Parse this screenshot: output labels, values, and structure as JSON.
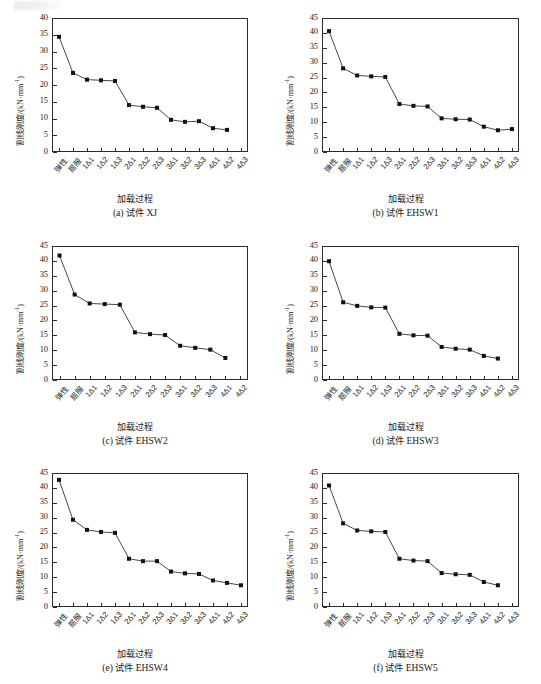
{
  "figure": {
    "axis_title_x": "加载过程",
    "axis_title_y_main": "割线刚度/(kN·mm",
    "axis_title_y_sup": "-1",
    "axis_title_y_tail": ")",
    "categories_full": [
      "弹性",
      "屈服",
      "1Δ1",
      "1Δ2",
      "1Δ3",
      "2Δ1",
      "2Δ2",
      "2Δ3",
      "3Δ1",
      "3Δ2",
      "3Δ3",
      "4Δ1",
      "4Δ2",
      "4Δ3"
    ],
    "marker_color": "#111111",
    "line_color": "#333333"
  },
  "chart_data": [
    {
      "type": "line",
      "panel_id": "a",
      "caption_index": "(a)",
      "caption_prefix": "试件",
      "caption_name": "XJ",
      "title": "(a) 试件 XJ",
      "xlabel": "加载过程",
      "ylabel": "割线刚度/(kN·mm⁻¹)",
      "ylim": [
        0,
        40
      ],
      "yticks": [
        0,
        5,
        10,
        15,
        20,
        25,
        30,
        35,
        40
      ],
      "categories": [
        "弹性",
        "屈服",
        "1Δ1",
        "1Δ2",
        "1Δ3",
        "2Δ1",
        "2Δ2",
        "2Δ3",
        "3Δ1",
        "3Δ2",
        "3Δ3",
        "4Δ1",
        "4Δ2",
        "4Δ3"
      ],
      "values": [
        34.4,
        23.6,
        21.6,
        21.4,
        21.2,
        14.0,
        13.5,
        13.2,
        9.6,
        9.0,
        9.2,
        7.1,
        6.6
      ],
      "grid": false,
      "legend": "none"
    },
    {
      "type": "line",
      "panel_id": "b",
      "caption_index": "(b)",
      "caption_prefix": "试件",
      "caption_name": "EHSW1",
      "title": "(b) 试件 EHSW1",
      "xlabel": "加载过程",
      "ylabel": "割线刚度/(kN·mm⁻¹)",
      "ylim": [
        0,
        45
      ],
      "yticks": [
        0,
        5,
        10,
        15,
        20,
        25,
        30,
        35,
        40,
        45
      ],
      "categories": [
        "弹性",
        "屈服",
        "1Δ1",
        "1Δ2",
        "1Δ3",
        "2Δ1",
        "2Δ2",
        "2Δ3",
        "3Δ1",
        "3Δ2",
        "3Δ3",
        "4Δ1",
        "4Δ2",
        "4Δ3"
      ],
      "values": [
        40.6,
        28.1,
        25.7,
        25.4,
        25.2,
        16.1,
        15.5,
        15.3,
        11.3,
        11.0,
        10.9,
        8.5,
        7.3,
        7.7
      ],
      "grid": false,
      "legend": "none"
    },
    {
      "type": "line",
      "panel_id": "c",
      "caption_index": "(c)",
      "caption_prefix": "试件",
      "caption_name": "EHSW2",
      "title": "(c) 试件 EHSW2",
      "xlabel": "加载过程",
      "ylabel": "割线刚度/(kN·mm⁻¹)",
      "ylim": [
        0,
        45
      ],
      "yticks": [
        0,
        5,
        10,
        15,
        20,
        25,
        30,
        35,
        40,
        45
      ],
      "categories": [
        "弹性",
        "屈服",
        "1Δ1",
        "1Δ2",
        "1Δ3",
        "2Δ1",
        "2Δ2",
        "2Δ3",
        "3Δ1",
        "3Δ2",
        "3Δ3",
        "4Δ1",
        "4Δ2"
      ],
      "values": [
        41.8,
        28.7,
        25.7,
        25.5,
        25.3,
        16.0,
        15.4,
        15.1,
        11.5,
        10.8,
        10.2,
        7.4
      ],
      "grid": false,
      "legend": "none"
    },
    {
      "type": "line",
      "panel_id": "d",
      "caption_index": "(d)",
      "caption_prefix": "试件",
      "caption_name": "EHSW3",
      "title": "(d) 试件 EHSW3",
      "xlabel": "加载过程",
      "ylabel": "割线刚度/(kN·mm⁻¹)",
      "ylim": [
        0,
        45
      ],
      "yticks": [
        0,
        5,
        10,
        15,
        20,
        25,
        30,
        35,
        40,
        45
      ],
      "categories": [
        "弹性",
        "屈服",
        "1Δ1",
        "1Δ2",
        "1Δ3",
        "2Δ1",
        "2Δ2",
        "2Δ3",
        "3Δ1",
        "3Δ2",
        "3Δ3",
        "4Δ1",
        "4Δ2",
        "4Δ3"
      ],
      "values": [
        39.9,
        26.1,
        24.9,
        24.4,
        24.3,
        15.5,
        15.0,
        14.9,
        11.1,
        10.5,
        10.2,
        8.1,
        7.2
      ],
      "grid": false,
      "legend": "none"
    },
    {
      "type": "line",
      "panel_id": "e",
      "caption_index": "(e)",
      "caption_prefix": "试件",
      "caption_name": "EHSW4",
      "title": "(e) 试件 EHSW4",
      "xlabel": "加载过程",
      "ylabel": "割线刚度/(kN·mm⁻¹)",
      "ylim": [
        0,
        45
      ],
      "yticks": [
        0,
        5,
        10,
        15,
        20,
        25,
        30,
        35,
        40,
        45
      ],
      "categories": [
        "弹性",
        "屈服",
        "1Δ1",
        "1Δ2",
        "1Δ3",
        "2Δ1",
        "2Δ2",
        "2Δ3",
        "3Δ1",
        "3Δ2",
        "3Δ3",
        "4Δ1",
        "4Δ2",
        "4Δ3"
      ],
      "values": [
        42.7,
        29.3,
        25.9,
        25.2,
        24.9,
        16.2,
        15.4,
        15.4,
        11.9,
        11.3,
        11.1,
        8.9,
        8.1,
        7.3
      ],
      "grid": false,
      "legend": "none"
    },
    {
      "type": "line",
      "panel_id": "f",
      "caption_index": "(f)",
      "caption_prefix": "试件",
      "caption_name": "EHSW5",
      "title": "(f) 试件 EHSW5",
      "xlabel": "加载过程",
      "ylabel": "割线刚度/(kN·mm⁻¹)",
      "ylim": [
        0,
        45
      ],
      "yticks": [
        0,
        5,
        10,
        15,
        20,
        25,
        30,
        35,
        40,
        45
      ],
      "categories": [
        "弹性",
        "屈服",
        "1Δ1",
        "1Δ2",
        "1Δ3",
        "2Δ1",
        "2Δ2",
        "2Δ3",
        "3Δ1",
        "3Δ2",
        "3Δ3",
        "4Δ1",
        "4Δ2",
        "4Δ3"
      ],
      "values": [
        40.8,
        28.1,
        25.7,
        25.4,
        25.2,
        16.2,
        15.6,
        15.4,
        11.4,
        11.0,
        10.8,
        8.4,
        7.3
      ],
      "grid": false,
      "legend": "none"
    }
  ]
}
